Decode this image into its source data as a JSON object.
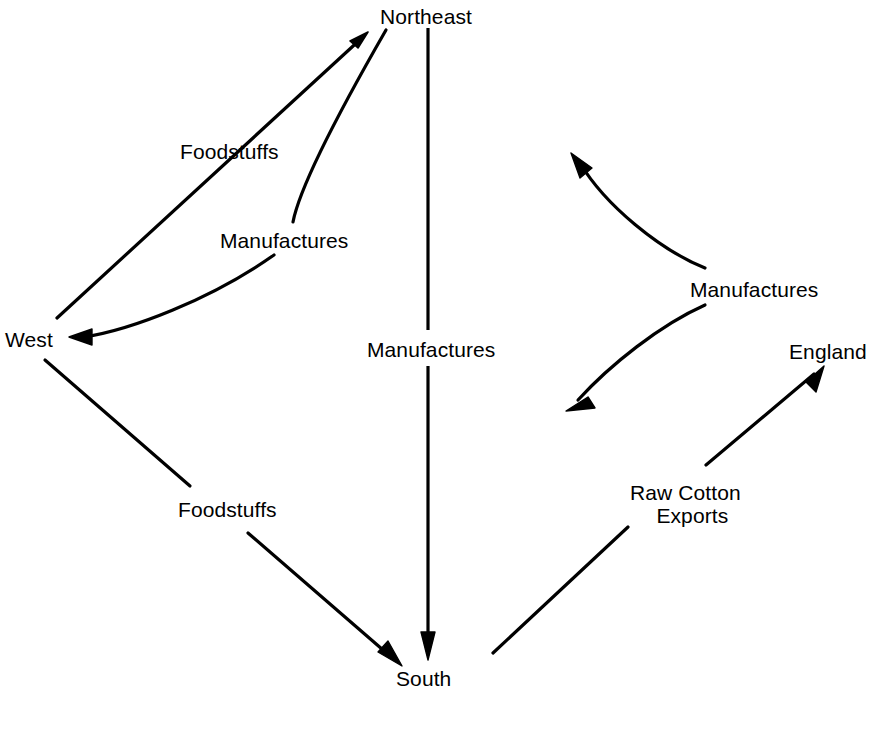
{
  "figure": {
    "type": "flow-diagram",
    "background_color": "#ffffff",
    "stroke_color": "#000000",
    "text_color": "#000000",
    "width": 877,
    "height": 745
  },
  "nodes": [
    {
      "id": "northeast",
      "label": "Northeast",
      "x": 428,
      "y": 15
    },
    {
      "id": "west",
      "label": "West",
      "x": 32,
      "y": 338
    },
    {
      "id": "south",
      "label": "South",
      "x": 428,
      "y": 677
    },
    {
      "id": "england",
      "label": "England",
      "x": 822,
      "y": 350
    }
  ],
  "flow_labels": [
    {
      "id": "west-to-northeast",
      "label": "Foodstuffs",
      "x": 230,
      "y": 150
    },
    {
      "id": "northeast-to-west",
      "label": "Manufactures",
      "x": 282,
      "y": 239
    },
    {
      "id": "northeast-to-south",
      "label": "Manufactures",
      "x": 428,
      "y": 348
    },
    {
      "id": "west-to-south",
      "label": "Foodstuffs",
      "x": 228,
      "y": 508
    },
    {
      "id": "north-to-south-mfg",
      "label": "Manufactures",
      "x": 752,
      "y": 288
    },
    {
      "id": "south-to-england",
      "line1": "Raw Cotton",
      "line2": "Exports",
      "x": 682,
      "y": 491
    }
  ],
  "arrows": [
    {
      "id": "arrow-west-to-northeast",
      "from": "West",
      "to": "Northeast",
      "style": "straight",
      "label": "Foodstuffs"
    },
    {
      "id": "arrow-northeast-to-west",
      "from": "Northeast",
      "to": "West",
      "style": "curved",
      "label": "Manufactures"
    },
    {
      "id": "arrow-northeast-to-south",
      "from": "Northeast",
      "to": "South",
      "style": "straight",
      "label": "Manufactures"
    },
    {
      "id": "arrow-west-to-south",
      "from": "West",
      "to": "South",
      "style": "straight",
      "label": "Foodstuffs"
    },
    {
      "id": "arrow-south-to-upper-right",
      "from": "South",
      "to": "Northeast",
      "style": "curved",
      "label": "Manufactures"
    },
    {
      "id": "arrow-upper-to-south",
      "from": "Northeast",
      "to": "South",
      "style": "curved",
      "label": "Manufactures"
    },
    {
      "id": "arrow-south-to-england",
      "from": "South",
      "to": "England",
      "style": "straight",
      "label": "Raw Cotton Exports"
    }
  ],
  "caption": {
    "text": "",
    "visible": false
  }
}
